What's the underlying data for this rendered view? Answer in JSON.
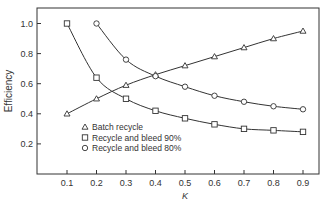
{
  "chart_data": {
    "type": "line",
    "title": "",
    "xlabel": "K",
    "ylabel": "Efficiency",
    "x": [
      0.1,
      0.2,
      0.3,
      0.4,
      0.5,
      0.6,
      0.7,
      0.8,
      0.9
    ],
    "x_ticks": [
      "0.1",
      "0.2",
      "0.3",
      "0.4",
      "0.5",
      "0.6",
      "0.7",
      "0.8",
      "0.9"
    ],
    "y_ticks": [
      "0.2",
      "0.4",
      "0.6",
      "0.8",
      "1.0"
    ],
    "xlim": [
      0,
      0.95
    ],
    "ylim": [
      0,
      1.1
    ],
    "grid": false,
    "legend_position": "lower left (inside)",
    "series": [
      {
        "name": "Batch recycle",
        "marker": "triangle",
        "x": [
          0.1,
          0.2,
          0.3,
          0.4,
          0.5,
          0.6,
          0.7,
          0.8,
          0.9
        ],
        "values": [
          0.4,
          0.5,
          0.59,
          0.66,
          0.72,
          0.78,
          0.84,
          0.9,
          0.95
        ]
      },
      {
        "name": "Recycle and bleed 90%",
        "marker": "square",
        "x": [
          0.1,
          0.2,
          0.3,
          0.4,
          0.5,
          0.6,
          0.7,
          0.8,
          0.9
        ],
        "values": [
          1.0,
          0.64,
          0.5,
          0.42,
          0.37,
          0.33,
          0.3,
          0.29,
          0.28
        ]
      },
      {
        "name": "Recycle and bleed 80%",
        "marker": "circle",
        "x": [
          0.2,
          0.3,
          0.4,
          0.5,
          0.6,
          0.7,
          0.8,
          0.9
        ],
        "values": [
          1.0,
          0.76,
          0.65,
          0.58,
          0.52,
          0.48,
          0.45,
          0.43
        ]
      }
    ]
  }
}
